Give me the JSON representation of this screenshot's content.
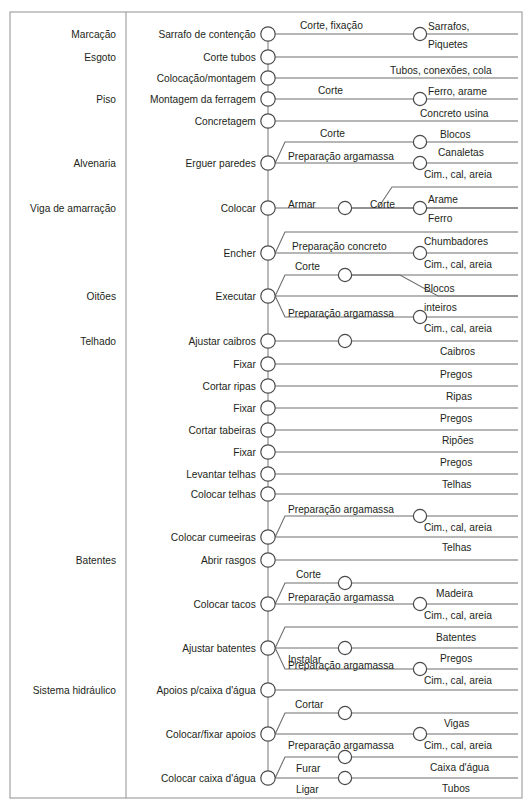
{
  "figure": {
    "type": "process-flow-diagram",
    "width": 531,
    "height": 811,
    "background_color": "#ffffff",
    "frame_color": "#9a9a9a",
    "line_color": "#6e6e6e",
    "node_fill": "#ffffff",
    "node_stroke": "#4a4a4a",
    "text_color": "#231f20"
  },
  "layout": {
    "frame": {
      "x": 10,
      "y": 12,
      "width": 512,
      "height": 786
    },
    "divider_x": 126,
    "spine_x": 268,
    "right_edge_x": 518,
    "node_radius": 7.2,
    "sub_node_radius": 6.6,
    "row_height": 22
  },
  "categories": [
    {
      "label": "Marcação",
      "y": 34
    },
    {
      "label": "Esgoto",
      "y": 57
    },
    {
      "label": "Piso",
      "y": 99
    },
    {
      "label": "Alvenaria",
      "y": 163
    },
    {
      "label": "Viga de amarração",
      "y": 208
    },
    {
      "label": "Oitões",
      "y": 296
    },
    {
      "label": "Telhado",
      "y": 341
    },
    {
      "label": "Batentes",
      "y": 560
    },
    {
      "label": "Sistema hidráulico",
      "y": 690
    }
  ],
  "tasks": [
    {
      "name": "Sarrafo de contenção",
      "y": 34,
      "branches": [
        {
          "operation": "Corte, fixação",
          "op_x": 300,
          "op_dy": -9,
          "node_x": 420,
          "line_y": 34,
          "materials": [
            {
              "label": "Sarrafos,",
              "x": 428,
              "y": 26
            },
            {
              "label": "Piquetes",
              "x": 428,
              "y": 44
            }
          ]
        }
      ]
    },
    {
      "name": "Corte tubos",
      "y": 57,
      "branches": [
        {
          "operation": "",
          "op_x": 0,
          "op_dy": 0,
          "node_x": null,
          "line_y": 57,
          "materials": []
        }
      ]
    },
    {
      "name": "Colocação/montagem",
      "y": 78,
      "branches": [
        {
          "operation": "",
          "op_x": 0,
          "op_dy": 0,
          "node_x": null,
          "line_y": 78,
          "materials": [
            {
              "label": "Tubos, conexões, cola",
              "x": 390,
              "y": 70
            }
          ]
        }
      ]
    },
    {
      "name": "Montagem da ferragem",
      "y": 99,
      "branches": [
        {
          "operation": "Corte",
          "op_x": 318,
          "op_dy": -9,
          "node_x": 420,
          "line_y": 99,
          "materials": [
            {
              "label": "Ferro, arame",
              "x": 428,
              "y": 91
            }
          ]
        }
      ]
    },
    {
      "name": "Concretagem",
      "y": 121,
      "branches": [
        {
          "operation": "",
          "op_x": 0,
          "op_dy": 0,
          "node_x": null,
          "line_y": 121,
          "materials": [
            {
              "label": "Concreto usina",
              "x": 420,
              "y": 113
            }
          ]
        }
      ]
    },
    {
      "name": "Erguer paredes",
      "y": 163,
      "branches": [
        {
          "operation": "Corte",
          "op_x": 320,
          "op_dy": -9,
          "node_x": 420,
          "line_y": 142,
          "elbow_x": 285,
          "materials": [
            {
              "label": "Blocos",
              "x": 440,
              "y": 134
            },
            {
              "label": "Canaletas",
              "x": 438,
              "y": 152
            }
          ]
        },
        {
          "operation": "Preparação argamassa",
          "op_x": 288,
          "op_dy": -7,
          "node_x": 420,
          "line_y": 163,
          "materials": [
            {
              "label": "Cim., cal, areia",
              "x": 424,
              "y": 174
            }
          ]
        }
      ]
    },
    {
      "name": "Colocar",
      "y": 208,
      "branches": [
        {
          "operation": "Armar",
          "op_x": 288,
          "op_dy": -4,
          "node_x": 345,
          "line_y": 208,
          "materials": []
        },
        {
          "operation": "Corte",
          "op_x": 370,
          "op_dy": -4,
          "node_x": 420,
          "line_y": 208,
          "from_x": 345,
          "riser_x": 378,
          "riser_y": 187,
          "materials": [
            {
              "label": "Arame",
              "x": 428,
              "y": 199
            },
            {
              "label": "Ferro",
              "x": 428,
              "y": 218
            }
          ]
        }
      ]
    },
    {
      "name": "Encher",
      "y": 253,
      "branches": [
        {
          "operation": "Preparação concreto",
          "op_x": 292,
          "op_dy": -7,
          "node_x": 420,
          "line_y": 253,
          "elbow_x": 285,
          "riser_y": 232,
          "materials": [
            {
              "label": "Chumbadores",
              "x": 424,
              "y": 241
            },
            {
              "label": "Cim., cal, areia",
              "x": 424,
              "y": 264
            }
          ]
        }
      ]
    },
    {
      "name": "Executar",
      "y": 296,
      "branches": [
        {
          "operation": "Corte",
          "op_x": 295,
          "op_dy": -9,
          "node_x": 345,
          "line_y": 275,
          "elbow_x": 285,
          "rejoin": true,
          "materials": []
        },
        {
          "operation": "",
          "op_x": 0,
          "op_dy": 0,
          "node_x": null,
          "line_y": 296,
          "materials": [
            {
              "label": "Blocos",
              "x": 424,
              "y": 288
            },
            {
              "label": "inteiros",
              "x": 424,
              "y": 307
            }
          ]
        },
        {
          "operation": "Preparação argamassa",
          "op_x": 288,
          "op_dy": -4,
          "node_x": 420,
          "line_y": 317,
          "elbow_x": 285,
          "materials": [
            {
              "label": "Cim., cal, areia",
              "x": 424,
              "y": 328
            }
          ]
        }
      ]
    },
    {
      "name": "Ajustar caibros",
      "y": 341,
      "branches": [
        {
          "operation": "",
          "op_x": 0,
          "op_dy": 0,
          "node_x": 345,
          "line_y": 341,
          "materials": [
            {
              "label": "Caibros",
              "x": 440,
              "y": 351
            }
          ]
        }
      ]
    },
    {
      "name": "Fixar",
      "y": 364,
      "branches": [
        {
          "operation": "",
          "op_x": 0,
          "op_dy": 0,
          "node_x": null,
          "line_y": 364,
          "materials": [
            {
              "label": "Pregos",
              "x": 440,
              "y": 374
            }
          ]
        }
      ]
    },
    {
      "name": "Cortar ripas",
      "y": 386,
      "branches": [
        {
          "operation": "",
          "op_x": 0,
          "op_dy": 0,
          "node_x": null,
          "line_y": 386,
          "materials": [
            {
              "label": "Ripas",
              "x": 446,
              "y": 396
            }
          ]
        }
      ]
    },
    {
      "name": "Fixar",
      "y": 408,
      "branches": [
        {
          "operation": "",
          "op_x": 0,
          "op_dy": 0,
          "node_x": null,
          "line_y": 408,
          "materials": [
            {
              "label": "Pregos",
              "x": 440,
              "y": 418
            }
          ]
        }
      ]
    },
    {
      "name": "Cortar tabeiras",
      "y": 430,
      "branches": [
        {
          "operation": "",
          "op_x": 0,
          "op_dy": 0,
          "node_x": null,
          "line_y": 430,
          "materials": [
            {
              "label": "Ripões",
              "x": 442,
              "y": 440
            }
          ]
        }
      ]
    },
    {
      "name": "Fixar",
      "y": 452,
      "branches": [
        {
          "operation": "",
          "op_x": 0,
          "op_dy": 0,
          "node_x": null,
          "line_y": 452,
          "materials": [
            {
              "label": "Pregos",
              "x": 440,
              "y": 462
            }
          ]
        }
      ]
    },
    {
      "name": "Levantar telhas",
      "y": 474,
      "branches": [
        {
          "operation": "",
          "op_x": 0,
          "op_dy": 0,
          "node_x": null,
          "line_y": 474,
          "materials": [
            {
              "label": "Telhas",
              "x": 442,
              "y": 484
            }
          ]
        }
      ]
    },
    {
      "name": "Colocar telhas",
      "y": 494,
      "branches": [
        {
          "operation": "",
          "op_x": 0,
          "op_dy": 0,
          "node_x": null,
          "line_y": 494,
          "materials": []
        }
      ]
    },
    {
      "name": "Colocar cumeeiras",
      "y": 537,
      "branches": [
        {
          "operation": "Preparação argamassa",
          "op_x": 288,
          "op_dy": -7,
          "node_x": 420,
          "line_y": 516,
          "elbow_x": 285,
          "materials": [
            {
              "label": "Cim., cal, areia",
              "x": 424,
              "y": 527
            }
          ]
        },
        {
          "operation": "",
          "op_x": 0,
          "op_dy": 0,
          "node_x": null,
          "line_y": 537,
          "materials": [
            {
              "label": "Telhas",
              "x": 442,
              "y": 547
            }
          ]
        }
      ]
    },
    {
      "name": "Abrir rasgos",
      "y": 560,
      "branches": [
        {
          "operation": "",
          "op_x": 0,
          "op_dy": 0,
          "node_x": null,
          "line_y": 560,
          "materials": []
        }
      ]
    },
    {
      "name": "Colocar tacos",
      "y": 604,
      "branches": [
        {
          "operation": "Corte",
          "op_x": 296,
          "op_dy": -9,
          "node_x": 345,
          "line_y": 583,
          "elbow_x": 285,
          "materials": [
            {
              "label": "Madeira",
              "x": 436,
              "y": 593
            }
          ]
        },
        {
          "operation": "Preparação argamassa",
          "op_x": 288,
          "op_dy": -7,
          "node_x": 420,
          "line_y": 604,
          "materials": [
            {
              "label": "Cim., cal, areia",
              "x": 424,
              "y": 615
            }
          ]
        }
      ]
    },
    {
      "name": "Ajustar batentes",
      "y": 648,
      "branches": [
        {
          "operation": "",
          "op_x": 0,
          "op_dy": 0,
          "node_x": null,
          "line_y": 627,
          "elbow_x": 285,
          "materials": [
            {
              "label": "Batentes",
              "x": 436,
              "y": 637
            }
          ]
        },
        {
          "operation": "Instalar",
          "op_x": 288,
          "op_dy": 11,
          "node_x": 345,
          "line_y": 648,
          "materials": [
            {
              "label": "Pregos",
              "x": 440,
              "y": 658
            }
          ]
        },
        {
          "operation": "Preparação argamassa",
          "op_x": 288,
          "op_dy": -4,
          "node_x": 420,
          "line_y": 669,
          "elbow_x": 285,
          "materials": [
            {
              "label": "Cim., cal, areia",
              "x": 424,
              "y": 680
            }
          ]
        }
      ]
    },
    {
      "name": "Apoios p/caixa d'água",
      "y": 690,
      "branches": [
        {
          "operation": "",
          "op_x": 0,
          "op_dy": 0,
          "node_x": null,
          "line_y": 690,
          "materials": []
        }
      ]
    },
    {
      "name": "Colocar/fixar apoios",
      "y": 734,
      "branches": [
        {
          "operation": "Cortar",
          "op_x": 295,
          "op_dy": -9,
          "node_x": 345,
          "line_y": 713,
          "elbow_x": 285,
          "materials": [
            {
              "label": "Vigas",
              "x": 444,
              "y": 723
            }
          ]
        },
        {
          "operation": "Preparação argamassa",
          "op_x": 288,
          "op_dy": 11,
          "node_x": 420,
          "line_y": 734,
          "materials": [
            {
              "label": "Cim., cal, areia",
              "x": 424,
              "y": 745
            }
          ]
        }
      ]
    },
    {
      "name": "Colocar caixa d'água",
      "y": 778,
      "branches": [
        {
          "operation": "Furar",
          "op_x": 296,
          "op_dy": 11,
          "node_x": 345,
          "line_y": 757,
          "elbow_x": 285,
          "materials": [
            {
              "label": "Caixa d'água",
              "x": 430,
              "y": 767
            }
          ]
        },
        {
          "operation": "Ligar",
          "op_x": 296,
          "op_dy": 11,
          "node_x": 345,
          "line_y": 778,
          "materials": [
            {
              "label": "Tubos",
              "x": 442,
              "y": 788
            }
          ]
        }
      ]
    }
  ]
}
